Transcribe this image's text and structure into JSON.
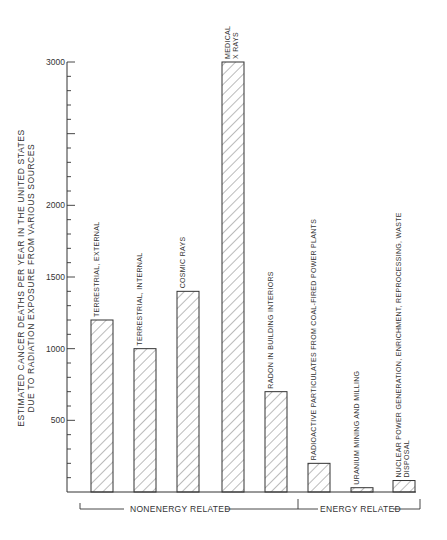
{
  "chart_data": {
    "type": "bar",
    "title": "",
    "xlabel": "",
    "ylabel": "ESTIMATED CANCER DEATHS PER YEAR IN THE UNITED STATES DUE TO RADIATION EXPOSURE FROM VARIOUS SOURCES",
    "ylabel_lines": [
      "ESTIMATED CANCER DEATHS PER YEAR  IN THE UNITED STATES",
      "DUE TO RADIATION EXPOSURE   FROM VARIOUS SOURCES"
    ],
    "ylim": [
      0,
      3000
    ],
    "yticks": [
      500,
      1000,
      1500,
      2000,
      3000
    ],
    "yticks_labeled": [
      "500",
      "1000",
      "1500",
      "2000",
      "3000"
    ],
    "minor_tick_step": 100,
    "grid": false,
    "legend": null,
    "categories": [
      "TERRESTRIAL, EXTERNAL",
      "TERRESTRIAL, INTERNAL",
      "COSMIC RAYS",
      "MEDICAL X RAYS",
      "RADON IN BUILDING INTERIORS",
      "RADIOACTIVE PARTICULATES FROM COAL-FIRED POWER PLANTS",
      "URANIUM MINING AND MILLING",
      "NUCLEAR POWER GENERATION, ENRICHMENT, REPROCESSING, WASTE DISPOSAL"
    ],
    "values": [
      1200,
      1000,
      1400,
      3000,
      700,
      200,
      30,
      80
    ],
    "bar_label_lines": [
      [
        "TERRESTRIAL, EXTERNAL"
      ],
      [
        "TERRESTRIAL, INTERNAL"
      ],
      [
        "COSMIC RAYS"
      ],
      [
        "MEDICAL",
        "X RAYS"
      ],
      [
        "RADON IN BUILDING INTERIORS"
      ],
      [
        "RADIOACTIVE  PARTICULATES FROM COAL-FIRED POWER PLANTS"
      ],
      [
        "URANIUM MINING AND MILLING"
      ],
      [
        "NUCLEAR POWER GENERATION, ENRICHMENT, REPROCESSING, WASTE",
        "DISPOSAL"
      ]
    ],
    "groups": [
      {
        "label": "NONENERGY RELATED",
        "categories": [
          0,
          1,
          2,
          3,
          4
        ]
      },
      {
        "label": "ENERGY RELATED",
        "categories": [
          5,
          6,
          7
        ]
      }
    ],
    "bar_fill": "diagonal-hatch",
    "colors": {
      "line": "#333333",
      "hatch": "#555555",
      "background": "#ffffff"
    }
  }
}
